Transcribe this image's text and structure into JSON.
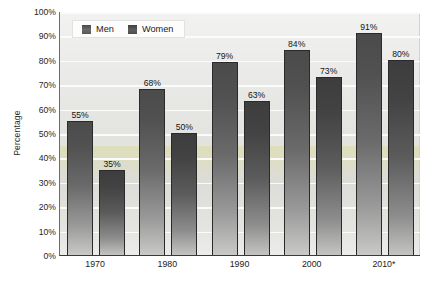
{
  "chart_data": {
    "type": "bar",
    "title": "",
    "subtitle": "",
    "xlabel": "",
    "ylabel": "Percentage",
    "categories": [
      "1970",
      "1980",
      "1990",
      "2000",
      "2010*"
    ],
    "series": [
      {
        "name": "Men",
        "values": [
          55,
          68,
          79,
          84,
          91
        ]
      },
      {
        "name": "Women",
        "values": [
          35,
          50,
          63,
          73,
          80
        ]
      }
    ],
    "value_labels": {
      "Men": [
        "55%",
        "68%",
        "79%",
        "84%",
        "91%"
      ],
      "Women": [
        "35%",
        "50%",
        "63%",
        "73%",
        "80%"
      ]
    },
    "ylim": [
      0,
      100
    ],
    "ytick_values": [
      0,
      10,
      20,
      30,
      40,
      50,
      60,
      70,
      80,
      90,
      100
    ],
    "ytick_labels": [
      "0%",
      "10%",
      "20%",
      "30%",
      "40%",
      "50%",
      "60%",
      "70%",
      "80%",
      "90%",
      "100%"
    ],
    "grid": true,
    "grid_axis": "y",
    "legend_position": "top-left-inside",
    "legend_entries": [
      "Men",
      "Women"
    ],
    "colors": {
      "men_bar_top": "#4b4b4b",
      "men_bar_bottom": "#c9c9c7",
      "women_bar_top": "#3d3d3d",
      "women_bar_bottom": "#c4c4c2",
      "bar_outline": "#2a2a2a",
      "plot_background": "#e6e6e3",
      "gridline": "#fbfbfa",
      "axis_line": "#3a3a3a",
      "text": "#1a1a1a",
      "canvas_background": "#ffffff"
    }
  },
  "axes": {
    "y_title": "Percentage"
  },
  "legend": {
    "entries": [
      {
        "label": "Men",
        "swatch_name": "legend-swatch-men"
      },
      {
        "label": "Women",
        "swatch_name": "legend-swatch-women"
      }
    ]
  },
  "footnote": {
    "text": ""
  }
}
